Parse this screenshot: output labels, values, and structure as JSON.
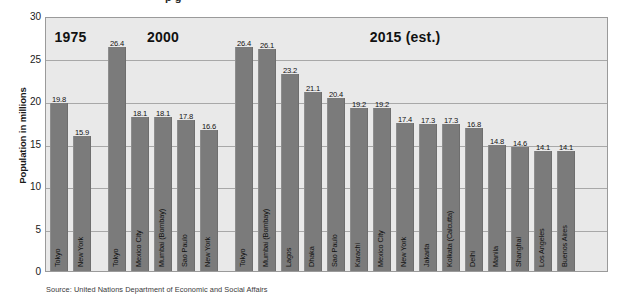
{
  "figure": {
    "title_partial": "p   g",
    "source_note": "Source:  United Nations Department of Economic and Social Affairs"
  },
  "chart_data": {
    "type": "bar",
    "title": "",
    "xlabel": "",
    "ylabel": "Population in millions",
    "ylim": [
      0,
      30
    ],
    "ytick_step": 5,
    "ytick_labels": [
      "30",
      "25",
      "20",
      "15",
      "10",
      "5",
      "0"
    ],
    "grid": true,
    "legend_position": "none",
    "bar_color": "#7b7b7b",
    "plot_background": "#e9e9e9",
    "group_labels": [
      "1975",
      "2000",
      "2015 (est.)"
    ],
    "groups": [
      {
        "label": "1975",
        "categories": [
          "Tokyo",
          "New York"
        ],
        "values": [
          19.8,
          15.9
        ]
      },
      {
        "label": "2000",
        "categories": [
          "Tokyo",
          "Mexico City",
          "Mumbai (Bombay)",
          "Sao Paulo",
          "New York"
        ],
        "values": [
          26.4,
          18.1,
          18.1,
          17.8,
          16.6
        ]
      },
      {
        "label": "2015 (est.)",
        "categories": [
          "Tokyo",
          "Mumbai (Bombay)",
          "Lagos",
          "Dhaka",
          "Sao Paulo",
          "Karachi",
          "Mexico City",
          "New York",
          "Jakarta",
          "Kolkata (Calcutta)",
          "Delhi",
          "Manila",
          "Shanghai",
          "Los Angeles",
          "Buenos Aires"
        ],
        "values": [
          26.4,
          26.1,
          23.2,
          21.1,
          20.4,
          19.2,
          19.2,
          17.4,
          17.3,
          17.3,
          16.8,
          14.8,
          14.6,
          14.1,
          14.1
        ]
      }
    ]
  }
}
